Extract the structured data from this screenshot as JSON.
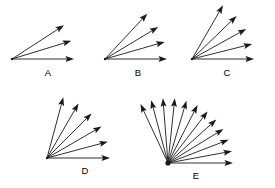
{
  "figure": {
    "background_color": "#ffffff",
    "stroke_color": "#1a1a1a",
    "label_color": "#000000",
    "width": 275,
    "height": 188,
    "diagrams": [
      {
        "id": "A",
        "label": "A",
        "vertex": {
          "x": 12,
          "y": 59
        },
        "label_pos": {
          "x": 48,
          "y": 76
        },
        "arrow_count": 3,
        "radius": 62,
        "angles_deg": [
          0,
          17,
          33
        ]
      },
      {
        "id": "B",
        "label": "B",
        "vertex": {
          "x": 105,
          "y": 59
        },
        "label_pos": {
          "x": 138,
          "y": 76
        },
        "arrow_count": 4,
        "radius": 62,
        "angles_deg": [
          0,
          16,
          31,
          47
        ]
      },
      {
        "id": "C",
        "label": "C",
        "vertex": {
          "x": 192,
          "y": 59
        },
        "label_pos": {
          "x": 227,
          "y": 76
        },
        "arrow_count": 5,
        "radius": 62,
        "angles_deg": [
          0,
          14,
          29,
          44,
          60
        ]
      },
      {
        "id": "D",
        "label": "D",
        "vertex": {
          "x": 47,
          "y": 158
        },
        "label_pos": {
          "x": 85,
          "y": 174
        },
        "arrow_count": 6,
        "radius": 63,
        "angles_deg": [
          0,
          15,
          30,
          45,
          60,
          75
        ]
      },
      {
        "id": "E",
        "label": "E",
        "vertex": {
          "x": 168,
          "y": 163
        },
        "label_pos": {
          "x": 196,
          "y": 179
        },
        "arrow_count": 12,
        "radius": 65,
        "angles_deg": [
          0,
          10.5,
          21,
          31.5,
          42,
          52.5,
          63,
          73.5,
          84,
          94.5,
          105,
          115
        ]
      }
    ]
  }
}
